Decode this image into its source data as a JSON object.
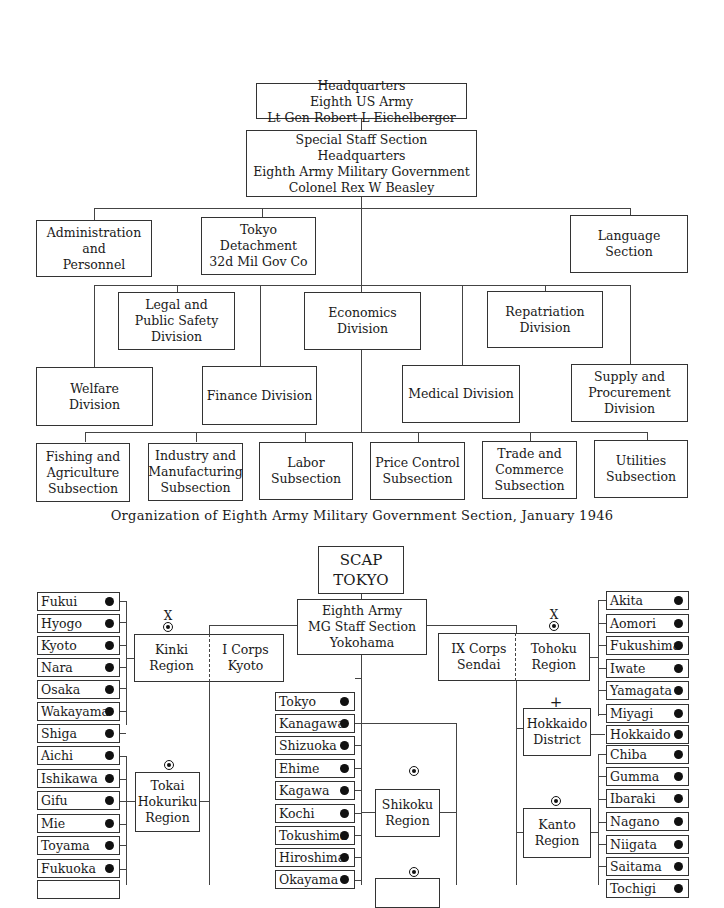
{
  "chart1": {
    "hq": [
      "Headquarters",
      "Eighth US Army",
      "Lt Gen Robert L Eichelberger"
    ],
    "special_staff": [
      "Special Staff Section",
      "Headquarters",
      "Eighth Army Military Government",
      "Colonel Rex W Beasley"
    ],
    "admin": [
      "Administration",
      "and",
      "Personnel"
    ],
    "tokyo_det": [
      "Tokyo",
      "Detachment",
      "32d Mil Gov Co"
    ],
    "language": [
      "Language",
      "Section"
    ],
    "legal": [
      "Legal and",
      "Public Safety",
      "Division"
    ],
    "economics": [
      "Economics",
      "Division"
    ],
    "repatriation": [
      "Repatriation",
      "Division"
    ],
    "welfare": [
      "Welfare",
      "Division"
    ],
    "finance": [
      "Finance Division"
    ],
    "medical": [
      "Medical Division"
    ],
    "supply": [
      "Supply and",
      "Procurement",
      "Division"
    ],
    "subsections": [
      [
        "Fishing and",
        "Agriculture",
        "Subsection"
      ],
      [
        "Industry and",
        "Manufacturing",
        "Subsection"
      ],
      [
        "Labor",
        "Subsection"
      ],
      [
        "Price Control",
        "Subsection"
      ],
      [
        "Trade and",
        "Commerce",
        "Subsection"
      ],
      [
        "Utilities",
        "Subsection"
      ]
    ],
    "caption": "Organization of Eighth Army Military Government Section, January 1946"
  },
  "chart2": {
    "scap": [
      "SCAP",
      "TOKYO"
    ],
    "eighth_army": [
      "Eighth Army",
      "MG Staff Section",
      "Yokohama"
    ],
    "kinki": [
      "Kinki",
      "Region"
    ],
    "i_corps": [
      "I Corps",
      "Kyoto"
    ],
    "ix_corps": [
      "IX Corps",
      "Sendai"
    ],
    "tohoku": [
      "Tohoku",
      "Region"
    ],
    "hokkaido_district": [
      "Hokkaido",
      "District"
    ],
    "tokai": [
      "Tokai",
      "Hokuriku",
      "Region"
    ],
    "shikoku": [
      "Shikoku",
      "Region"
    ],
    "kanto": [
      "Kanto",
      "Region"
    ],
    "left_prefectures": [
      "Fukui",
      "Hyogo",
      "Kyoto",
      "Nara",
      "Osaka",
      "Wakayama",
      "Shiga",
      "Aichi",
      "Ishikawa",
      "Gifu",
      "Mie",
      "Toyama",
      "Fukuoka",
      "Kumamoto"
    ],
    "center_prefectures": [
      "Tokyo",
      "Kanagawa",
      "Shizuoka",
      "Ehime",
      "Kagawa",
      "Kochi",
      "Tokushima",
      "Hiroshima",
      "Okayama"
    ],
    "right_prefectures": [
      "Akita",
      "Aomori",
      "Fukushima",
      "Iwate",
      "Yamagata",
      "Miyagi",
      "Hokkaido",
      "Chiba",
      "Gumma",
      "Ibaraki",
      "Nagano",
      "Niigata",
      "Saitama",
      "Tochigi"
    ],
    "corps_symbol": "X",
    "district_symbol": "+"
  }
}
